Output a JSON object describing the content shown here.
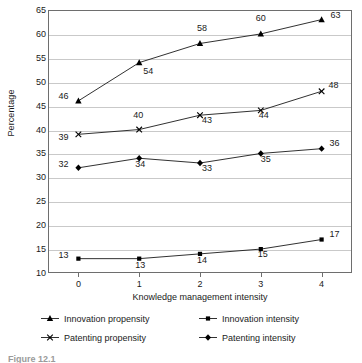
{
  "chart_data": {
    "type": "line",
    "title": "",
    "xlabel": "Knowledge management intensity",
    "ylabel": "Percentage",
    "x": [
      0,
      1,
      2,
      3,
      4
    ],
    "xticklabels": [
      "0",
      "1",
      "2",
      "3",
      "4"
    ],
    "yticklabels": [
      "10",
      "15",
      "20",
      "25",
      "30",
      "35",
      "40",
      "45",
      "50",
      "55",
      "60",
      "65"
    ],
    "yticks": [
      10,
      15,
      20,
      25,
      30,
      35,
      40,
      45,
      50,
      55,
      60,
      65
    ],
    "ylim": [
      10,
      65
    ],
    "xlim": [
      -0.5,
      4.5
    ],
    "grid": "horizontal",
    "legend_position": "bottom",
    "series": [
      {
        "name": "Innovation propensity",
        "marker": "triangle",
        "values": [
          46,
          54,
          58,
          60,
          63
        ],
        "labels": [
          "46",
          "54",
          "58",
          "60",
          "63"
        ]
      },
      {
        "name": "Innovation intensity",
        "marker": "square",
        "values": [
          13,
          13,
          14,
          15,
          17
        ],
        "labels": [
          "13",
          "13",
          "14",
          "15",
          "17"
        ]
      },
      {
        "name": "Patenting propensity",
        "marker": "cross",
        "values": [
          39,
          40,
          43,
          44,
          48
        ],
        "labels": [
          "39",
          "40",
          "43",
          "44",
          "48"
        ]
      },
      {
        "name": "Patenting intensity",
        "marker": "diamond",
        "values": [
          32,
          34,
          33,
          35,
          36
        ],
        "labels": [
          "32",
          "34",
          "33",
          "35",
          "36"
        ]
      }
    ],
    "colors": {
      "line": "#1a1a1a",
      "marker": "#000000",
      "grid": "#c9c9c9",
      "frame": "#6e6e6e",
      "text": "#1a1a1a",
      "background": "#ffffff"
    }
  },
  "caption": {
    "text": "Figure 12.1"
  }
}
